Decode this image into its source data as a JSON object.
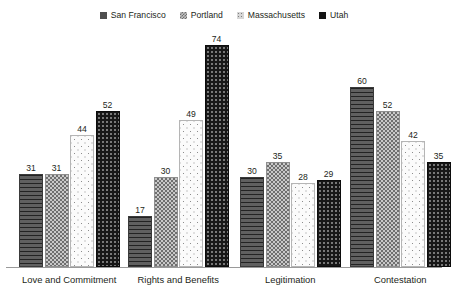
{
  "chart_data": {
    "type": "bar",
    "title": "",
    "subtitle": "",
    "xlabel": "",
    "ylabel": "",
    "grid": false,
    "legend_position": "top-center",
    "axis_visible": {
      "x": true,
      "y": false
    },
    "ylim": [
      0,
      80
    ],
    "categories": [
      "Love and Commitment",
      "Rights and Benefits",
      "Legitimation",
      "Contestation"
    ],
    "series": [
      {
        "name": "San Francisco",
        "values": [
          31,
          17,
          30,
          60
        ],
        "color": "#4e4e4e",
        "pattern": "horizontal-lines"
      },
      {
        "name": "Portland",
        "values": [
          31,
          30,
          35,
          52
        ],
        "color": "#c9c9c9",
        "pattern": "checkerboard"
      },
      {
        "name": "Massachusetts",
        "values": [
          44,
          49,
          28,
          42
        ],
        "color": "#fbfbfb",
        "pattern": "sparse-dots"
      },
      {
        "name": "Utah",
        "values": [
          52,
          74,
          29,
          35
        ],
        "color": "#171717",
        "pattern": "dark-dots"
      }
    ],
    "data_labels": [
      [
        31,
        31,
        44,
        52
      ],
      [
        17,
        30,
        49,
        74
      ],
      [
        30,
        35,
        28,
        29
      ],
      [
        60,
        52,
        42,
        35
      ]
    ]
  },
  "legend": {
    "items": [
      {
        "label": "San Francisco",
        "swatch": "sw-sf"
      },
      {
        "label": "Portland",
        "swatch": "sw-pdx"
      },
      {
        "label": "Massachusetts",
        "swatch": "sw-ma"
      },
      {
        "label": "Utah",
        "swatch": "sw-ut"
      }
    ]
  }
}
